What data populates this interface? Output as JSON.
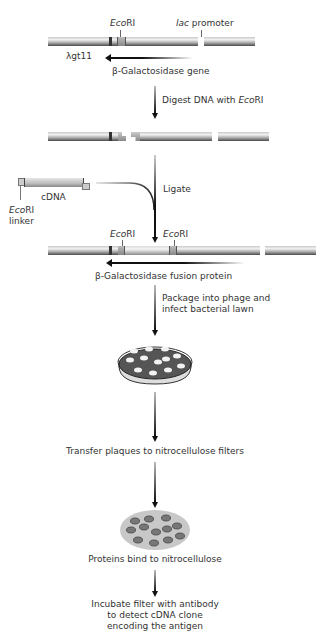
{
  "diagram": {
    "vector": {
      "name": "λgt11",
      "ecori_label_prefix": "Eco",
      "ecori_label_suffix": "RI",
      "lac_label_italic": "lac",
      "lac_label_rest": " promoter",
      "gene_label": "β-Galactosidase gene"
    },
    "steps": [
      {
        "id": "digest",
        "text_plain": "Digest DNA with ",
        "text_italic": "Eco",
        "text_suffix": "RI"
      },
      {
        "id": "ligate",
        "text": "Ligate"
      },
      {
        "id": "package",
        "line1": "Package into phage and",
        "line2": "infect bacterial lawn"
      },
      {
        "id": "transfer",
        "text": "Transfer plaques to nitrocellulose filters"
      },
      {
        "id": "bind",
        "text": "Proteins bind to nitrocellulose"
      },
      {
        "id": "incubate",
        "line1": "Incubate filter with antibody",
        "line2": "to detect cDNA clone",
        "line3": "encoding the antigen"
      }
    ],
    "insert": {
      "cdna_label": "cDNA",
      "linker_italic": "Eco",
      "linker_suffix": "RI",
      "linker_word": "linker"
    },
    "recombinant": {
      "ecori_left_italic": "Eco",
      "ecori_left_suffix": "RI",
      "ecori_right_italic": "Eco",
      "ecori_right_suffix": "RI",
      "fusion_label": "β-Galactosidase fusion protein"
    },
    "colors": {
      "dna_dark": "#4a4a4a",
      "dna_light": "#f2f2f2",
      "arrow": "#111111",
      "plate_dark": "#555555",
      "filter_gray": "#c8c8c8",
      "spot": "#777777"
    }
  }
}
